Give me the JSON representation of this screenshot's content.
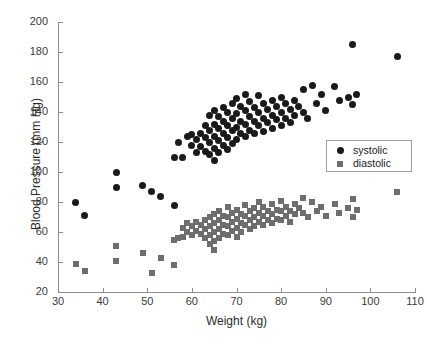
{
  "chart_data": {
    "type": "scatter",
    "title": "",
    "xlabel": "Weight (kg)",
    "ylabel": "Blood Pressure (mm Hg)",
    "xlim": [
      30,
      110
    ],
    "ylim": [
      20,
      200
    ],
    "xticks": [
      30,
      40,
      50,
      60,
      70,
      80,
      90,
      100,
      110
    ],
    "yticks": [
      20,
      40,
      60,
      80,
      100,
      120,
      140,
      160,
      180,
      200
    ],
    "grid": false,
    "legend_position": "right",
    "series": [
      {
        "name": "systolic",
        "marker": "circle",
        "color": "#1a1a1a",
        "points": [
          [
            34,
            80
          ],
          [
            36,
            71
          ],
          [
            43,
            100
          ],
          [
            43,
            90
          ],
          [
            49,
            91
          ],
          [
            51,
            87
          ],
          [
            53,
            84
          ],
          [
            56,
            78
          ],
          [
            56,
            110
          ],
          [
            57,
            120
          ],
          [
            58,
            110
          ],
          [
            59,
            124
          ],
          [
            60,
            125
          ],
          [
            60,
            118
          ],
          [
            61,
            122
          ],
          [
            61,
            113
          ],
          [
            62,
            126
          ],
          [
            62,
            117
          ],
          [
            63,
            131
          ],
          [
            63,
            123
          ],
          [
            63,
            114
          ],
          [
            64,
            138
          ],
          [
            64,
            128
          ],
          [
            64,
            120
          ],
          [
            64,
            112
          ],
          [
            65,
            141
          ],
          [
            65,
            132
          ],
          [
            65,
            124
          ],
          [
            65,
            116
          ],
          [
            65,
            108
          ],
          [
            66,
            137
          ],
          [
            66,
            129
          ],
          [
            66,
            121
          ],
          [
            66,
            113
          ],
          [
            67,
            143
          ],
          [
            67,
            134
          ],
          [
            67,
            126
          ],
          [
            67,
            118
          ],
          [
            68,
            140
          ],
          [
            68,
            131
          ],
          [
            68,
            123
          ],
          [
            68,
            115
          ],
          [
            69,
            146
          ],
          [
            69,
            136
          ],
          [
            69,
            128
          ],
          [
            69,
            119
          ],
          [
            70,
            149
          ],
          [
            70,
            139
          ],
          [
            70,
            130
          ],
          [
            70,
            122
          ],
          [
            71,
            144
          ],
          [
            71,
            134
          ],
          [
            71,
            126
          ],
          [
            72,
            152
          ],
          [
            72,
            141
          ],
          [
            72,
            132
          ],
          [
            72,
            124
          ],
          [
            73,
            147
          ],
          [
            73,
            137
          ],
          [
            73,
            128
          ],
          [
            74,
            143
          ],
          [
            74,
            134
          ],
          [
            74,
            126
          ],
          [
            75,
            151
          ],
          [
            75,
            140
          ],
          [
            75,
            131
          ],
          [
            76,
            146
          ],
          [
            76,
            136
          ],
          [
            76,
            127
          ],
          [
            77,
            142
          ],
          [
            77,
            133
          ],
          [
            78,
            148
          ],
          [
            78,
            138
          ],
          [
            78,
            129
          ],
          [
            79,
            144
          ],
          [
            79,
            135
          ],
          [
            80,
            150
          ],
          [
            80,
            140
          ],
          [
            80,
            131
          ],
          [
            81,
            146
          ],
          [
            81,
            136
          ],
          [
            82,
            142
          ],
          [
            82,
            133
          ],
          [
            83,
            148
          ],
          [
            83,
            138
          ],
          [
            84,
            144
          ],
          [
            85,
            155
          ],
          [
            85,
            140
          ],
          [
            86,
            136
          ],
          [
            87,
            158
          ],
          [
            88,
            146
          ],
          [
            89,
            152
          ],
          [
            90,
            141
          ],
          [
            92,
            157
          ],
          [
            93,
            148
          ],
          [
            95,
            150
          ],
          [
            96,
            185
          ],
          [
            96,
            145
          ],
          [
            97,
            152
          ],
          [
            106,
            177
          ]
        ]
      },
      {
        "name": "diastolic",
        "marker": "square",
        "color": "#6e6e6e",
        "points": [
          [
            34,
            39
          ],
          [
            36,
            34
          ],
          [
            43,
            51
          ],
          [
            43,
            41
          ],
          [
            49,
            46
          ],
          [
            51,
            33
          ],
          [
            53,
            43
          ],
          [
            56,
            38
          ],
          [
            56,
            55
          ],
          [
            57,
            56
          ],
          [
            58,
            63
          ],
          [
            58,
            57
          ],
          [
            59,
            66
          ],
          [
            59,
            60
          ],
          [
            60,
            64
          ],
          [
            60,
            58
          ],
          [
            61,
            67
          ],
          [
            61,
            61
          ],
          [
            62,
            65
          ],
          [
            62,
            59
          ],
          [
            63,
            68
          ],
          [
            63,
            62
          ],
          [
            63,
            56
          ],
          [
            64,
            70
          ],
          [
            64,
            64
          ],
          [
            64,
            58
          ],
          [
            64,
            52
          ],
          [
            65,
            72
          ],
          [
            65,
            66
          ],
          [
            65,
            60
          ],
          [
            65,
            54
          ],
          [
            65,
            48
          ],
          [
            66,
            74
          ],
          [
            66,
            68
          ],
          [
            66,
            62
          ],
          [
            66,
            56
          ],
          [
            67,
            71
          ],
          [
            67,
            65
          ],
          [
            67,
            59
          ],
          [
            68,
            77
          ],
          [
            68,
            70
          ],
          [
            68,
            64
          ],
          [
            68,
            58
          ],
          [
            69,
            73
          ],
          [
            69,
            67
          ],
          [
            69,
            61
          ],
          [
            70,
            75
          ],
          [
            70,
            69
          ],
          [
            70,
            63
          ],
          [
            70,
            57
          ],
          [
            71,
            72
          ],
          [
            71,
            66
          ],
          [
            71,
            60
          ],
          [
            72,
            78
          ],
          [
            72,
            71
          ],
          [
            72,
            65
          ],
          [
            73,
            74
          ],
          [
            73,
            68
          ],
          [
            73,
            62
          ],
          [
            74,
            76
          ],
          [
            74,
            70
          ],
          [
            74,
            64
          ],
          [
            75,
            80
          ],
          [
            75,
            73
          ],
          [
            75,
            67
          ],
          [
            76,
            77
          ],
          [
            76,
            71
          ],
          [
            76,
            65
          ],
          [
            77,
            74
          ],
          [
            77,
            68
          ],
          [
            78,
            79
          ],
          [
            78,
            72
          ],
          [
            78,
            66
          ],
          [
            79,
            75
          ],
          [
            79,
            69
          ],
          [
            80,
            81
          ],
          [
            80,
            74
          ],
          [
            80,
            68
          ],
          [
            81,
            77
          ],
          [
            81,
            71
          ],
          [
            82,
            74
          ],
          [
            82,
            67
          ],
          [
            83,
            79
          ],
          [
            83,
            72
          ],
          [
            84,
            76
          ],
          [
            85,
            83
          ],
          [
            85,
            73
          ],
          [
            86,
            70
          ],
          [
            87,
            80
          ],
          [
            88,
            74
          ],
          [
            89,
            77
          ],
          [
            90,
            71
          ],
          [
            92,
            79
          ],
          [
            93,
            73
          ],
          [
            95,
            76
          ],
          [
            96,
            82
          ],
          [
            96,
            70
          ],
          [
            97,
            75
          ],
          [
            106,
            87
          ]
        ]
      }
    ]
  },
  "legend": {
    "entries": [
      {
        "label": "systolic"
      },
      {
        "label": "diastolic"
      }
    ]
  }
}
